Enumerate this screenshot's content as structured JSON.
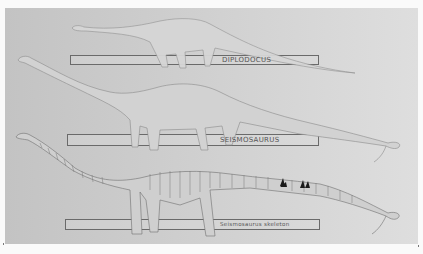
{
  "figure": {
    "colors": {
      "panel": "#c9c9c9",
      "outline": "#8a8a8a",
      "skeleton": "#6e6e6e",
      "dark_bones": "#1a1a1a",
      "border": "#fafafa"
    },
    "rows": [
      {
        "id": "diplodocus",
        "label": "DIPLODOCUS"
      },
      {
        "id": "seismosaurus",
        "label": "SEISMOSAURUS"
      },
      {
        "id": "skeleton",
        "label": "Seismosaurus skeleton"
      }
    ]
  }
}
